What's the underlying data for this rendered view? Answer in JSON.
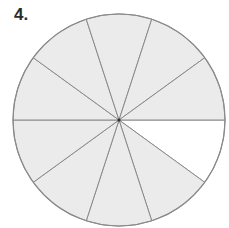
{
  "problem": {
    "number_label": "4."
  },
  "figure": {
    "type": "fraction-circle",
    "total_sectors": 10,
    "shaded_sectors": 9,
    "unshaded_sectors": 1,
    "unshaded_sector_index": 0,
    "center": [
      119,
      120
    ],
    "radius": 106,
    "colors": {
      "shaded": "#ebebeb",
      "unshaded": "#ffffff",
      "stroke": "#8a8a8a",
      "center_dot": "#333333"
    }
  }
}
